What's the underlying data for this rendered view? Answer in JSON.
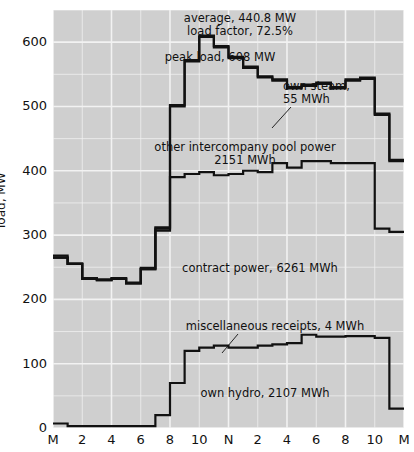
{
  "chart_data": {
    "type": "area",
    "title": "",
    "xlabel": "",
    "ylabel": "load, MW",
    "ylim": [
      0,
      650
    ],
    "xlim": [
      0,
      24
    ],
    "grid": true,
    "grid_major_step": 100,
    "grid_minor_step": 50,
    "legend": "none (in-plot annotations)",
    "x_tick_labels": [
      "M",
      "2",
      "4",
      "6",
      "8",
      "10",
      "N",
      "2",
      "4",
      "6",
      "8",
      "10",
      "M"
    ],
    "x_tick_hours": [
      0,
      2,
      4,
      6,
      8,
      10,
      12,
      14,
      16,
      18,
      20,
      22,
      24
    ],
    "y_tick_labels": [
      "0",
      "100",
      "200",
      "300",
      "400",
      "500",
      "600"
    ],
    "y_tick_values": [
      0,
      100,
      200,
      300,
      400,
      500,
      600
    ],
    "hours": [
      0,
      1,
      2,
      3,
      4,
      5,
      6,
      7,
      8,
      9,
      10,
      11,
      12,
      13,
      14,
      15,
      16,
      17,
      18,
      19,
      20,
      21,
      22,
      23
    ],
    "series": [
      {
        "name": "own hydro",
        "label": "own hydro, 2107 MWh",
        "values": [
          7,
          3,
          3,
          3,
          3,
          3,
          3,
          20,
          70,
          120,
          125,
          128,
          125,
          125,
          128,
          130,
          132,
          145,
          142,
          142,
          143,
          143,
          140,
          30
        ]
      },
      {
        "name": "miscellaneous receipts",
        "label": "miscellaneous receipts, 4 MWh",
        "values": [
          0,
          0,
          0,
          0,
          0,
          0,
          0,
          0,
          0,
          0,
          0,
          0,
          0,
          0,
          0,
          0,
          0,
          0,
          0,
          0,
          0,
          0,
          0,
          0
        ]
      },
      {
        "name": "contract power (cumulative top)",
        "label": "contract power, 6261 MWh",
        "values": [
          265,
          255,
          232,
          230,
          232,
          225,
          247,
          307,
          390,
          395,
          398,
          393,
          395,
          400,
          398,
          412,
          405,
          415,
          415,
          412,
          412,
          412,
          310,
          305
        ]
      },
      {
        "name": "other intercompany pool power (cumulative top)",
        "label": "other intercompany pool power, 2151 MWh",
        "values": [
          265,
          255,
          232,
          230,
          232,
          225,
          247,
          310,
          500,
          570,
          608,
          592,
          575,
          560,
          545,
          540,
          528,
          532,
          535,
          528,
          540,
          543,
          487,
          415
        ]
      },
      {
        "name": "own steam (cumulative top = total load)",
        "label": "own steam, 55 MWh",
        "values": [
          268,
          256,
          233,
          231,
          233,
          226,
          249,
          312,
          502,
          572,
          610,
          594,
          577,
          562,
          547,
          542,
          530,
          534,
          537,
          530,
          542,
          545,
          489,
          417
        ]
      }
    ],
    "annotations": [
      {
        "id": "average",
        "text": "average, 440.8 MW"
      },
      {
        "id": "load-factor",
        "text": "load factor, 72.5%"
      },
      {
        "id": "peak-load",
        "text": "peak load, 608 MW"
      },
      {
        "id": "own-steam-1",
        "text": "own steam,"
      },
      {
        "id": "own-steam-2",
        "text": "55 MWh"
      },
      {
        "id": "pool-power-1",
        "text": "other intercompany pool power"
      },
      {
        "id": "pool-power-2",
        "text": "2151 MWh"
      },
      {
        "id": "contract-power",
        "text": "contract power, 6261 MWh"
      },
      {
        "id": "misc-receipts",
        "text": "miscellaneous receipts, 4 MWh"
      },
      {
        "id": "own-hydro",
        "text": "own hydro, 2107 MWh"
      }
    ],
    "colors": {
      "plot_background": "#cfcfcf",
      "gridline": "#f2f2f2",
      "curve": "#111111",
      "page_background": "#ffffff",
      "text": "#111111"
    }
  }
}
